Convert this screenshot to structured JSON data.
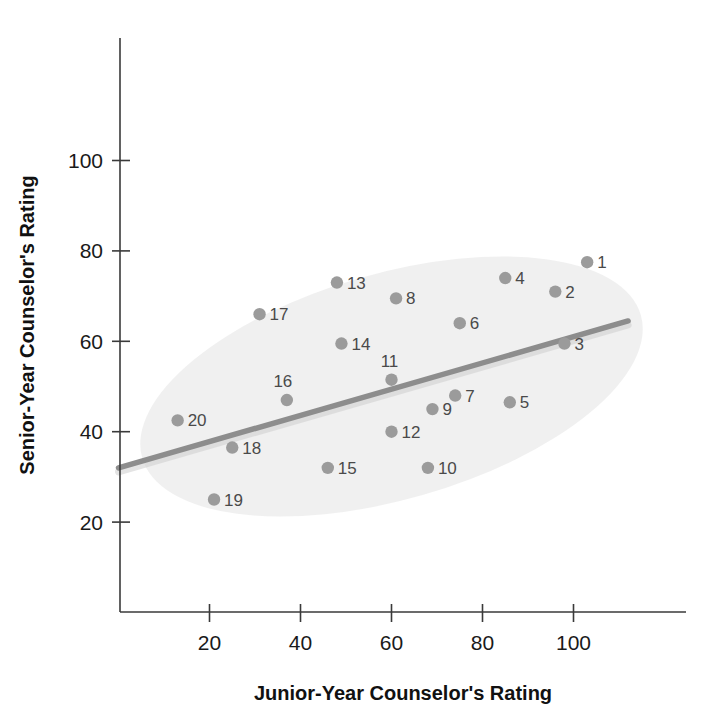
{
  "chart_data": {
    "type": "scatter",
    "title": "",
    "xlabel": "Junior-Year Counselor's Rating",
    "ylabel": "Senior-Year Counselor's Rating",
    "xlim": [
      0,
      124
    ],
    "ylim": [
      8,
      128
    ],
    "xticks": [
      20,
      40,
      60,
      80,
      100
    ],
    "yticks": [
      20,
      40,
      60,
      80,
      100
    ],
    "xtick_labels": [
      "20",
      "40",
      "60",
      "80",
      "100"
    ],
    "ytick_labels": [
      "20",
      "40",
      "60",
      "80",
      "100"
    ],
    "grid": false,
    "legend": "none",
    "point_color": "#9b9b9b",
    "trend_color": "#8d8d8d",
    "envelope_color": "#ededed",
    "points": [
      {
        "label": "1",
        "x": 103,
        "y": 77.5
      },
      {
        "label": "2",
        "x": 96,
        "y": 71
      },
      {
        "label": "3",
        "x": 98,
        "y": 59.5
      },
      {
        "label": "4",
        "x": 85,
        "y": 74
      },
      {
        "label": "5",
        "x": 86,
        "y": 46.5
      },
      {
        "label": "6",
        "x": 75,
        "y": 64
      },
      {
        "label": "7",
        "x": 74,
        "y": 48
      },
      {
        "label": "8",
        "x": 61,
        "y": 69.5
      },
      {
        "label": "9",
        "x": 69,
        "y": 45
      },
      {
        "label": "10",
        "x": 68,
        "y": 32
      },
      {
        "label": "11",
        "x": 60,
        "y": 51.5
      },
      {
        "label": "12",
        "x": 60,
        "y": 40
      },
      {
        "label": "13",
        "x": 48,
        "y": 73
      },
      {
        "label": "14",
        "x": 49,
        "y": 59.5
      },
      {
        "label": "15",
        "x": 46,
        "y": 32
      },
      {
        "label": "16",
        "x": 37,
        "y": 47
      },
      {
        "label": "17",
        "x": 31,
        "y": 66
      },
      {
        "label": "18",
        "x": 25,
        "y": 36.5
      },
      {
        "label": "19",
        "x": 21,
        "y": 25
      },
      {
        "label": "20",
        "x": 13,
        "y": 42.5
      }
    ],
    "trend_line": {
      "x_start": 0,
      "y_start": 32,
      "x_end": 112,
      "y_end": 64.5,
      "description": "positive linear regression line"
    },
    "envelope": {
      "center_x": 60,
      "center_y": 50,
      "semi_major": 57,
      "semi_minor": 25,
      "angle_deg": -16,
      "description": "light gray tilted ellipse enclosing the data cloud"
    },
    "point_count": 20
  }
}
